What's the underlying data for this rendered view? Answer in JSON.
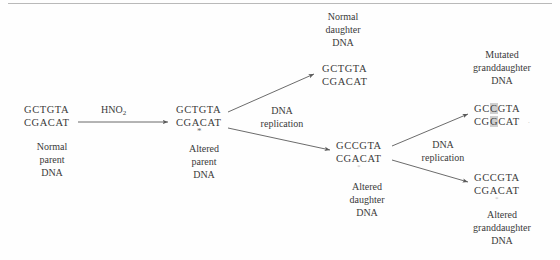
{
  "diagram": {
    "title_rule": "",
    "reagent": {
      "formula_main": "HNO",
      "formula_sub": "2"
    },
    "replication_label_1": {
      "line1": "DNA",
      "line2": "replication"
    },
    "replication_label_2": {
      "line1": "DNA",
      "line2": "replication"
    },
    "nodes": [
      {
        "id": "normal-parent",
        "caption": [
          "Normal",
          "parent",
          "DNA"
        ],
        "top_strand": "GCTGTA",
        "bottom_strand": "CGACAT",
        "top_highlight": [],
        "bottom_highlight": [],
        "marker": ""
      },
      {
        "id": "altered-parent",
        "caption": [
          "Altered",
          "parent",
          "DNA"
        ],
        "top_strand": "GCTGTA",
        "bottom_strand": "CGACAT",
        "top_highlight": [],
        "bottom_highlight": [],
        "marker": "*"
      },
      {
        "id": "normal-daughter",
        "caption": [
          "Normal",
          "daughter",
          "DNA"
        ],
        "top_strand": "GCTGTA",
        "bottom_strand": "CGACAT",
        "top_highlight": [],
        "bottom_highlight": [],
        "marker": ""
      },
      {
        "id": "altered-daughter",
        "caption": [
          "Altered",
          "daughter",
          "DNA"
        ],
        "top_strand": "GCCGTA",
        "bottom_strand": "CGACAT",
        "top_highlight": [],
        "bottom_highlight": [],
        "marker": "*"
      },
      {
        "id": "mutated-granddaughter",
        "caption": [
          "Mutated",
          "granddaughter",
          "DNA"
        ],
        "top_strand": "GCCGTA",
        "bottom_strand": "CGGCAT",
        "top_highlight": [
          2
        ],
        "bottom_highlight": [
          2
        ],
        "marker": ""
      },
      {
        "id": "altered-granddaughter",
        "caption": [
          "Altered",
          "granddaughter",
          "DNA"
        ],
        "top_strand": "GCCGTA",
        "bottom_strand": "CGACAT",
        "top_highlight": [],
        "bottom_highlight": [],
        "marker": "*"
      }
    ]
  }
}
